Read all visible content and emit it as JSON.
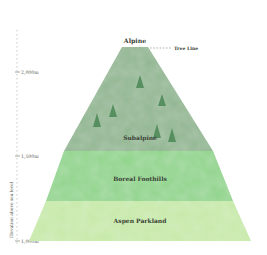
{
  "diagram": {
    "type": "elevation-zone-pyramid",
    "axis": {
      "title": "Elevation above sea level",
      "ticks": [
        {
          "label": "2,000m",
          "y": 72
        },
        {
          "label": "1,500m",
          "y": 156
        },
        {
          "label": "1,000m",
          "y": 241
        }
      ]
    },
    "peak_label": "Alpine",
    "tree_line_label": "Tree Line",
    "zones": [
      {
        "name": "Subalpine",
        "color": "#8fb58f"
      },
      {
        "name": "Boreal Foothills",
        "color": "#8fd48a"
      },
      {
        "name": "Aspen Parkland",
        "color": "#c6e9a8"
      }
    ],
    "trees_count": 6,
    "colors": {
      "subalpine": "#8fb58f",
      "boreal": "#8fd48a",
      "aspen": "#c6e9a8",
      "tree": "#4f8a5a",
      "text": "#3a3f36"
    }
  }
}
